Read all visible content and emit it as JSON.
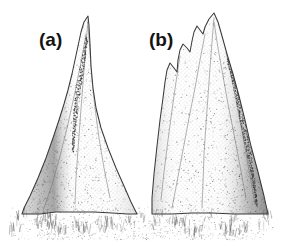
{
  "figure": {
    "medium": "pen-and-ink stipple drawing",
    "background_color": "#ffffff",
    "ink_color": "#3a3a3a",
    "width": 285,
    "height": 249
  },
  "panels": [
    {
      "id": "a",
      "label": "(a)",
      "label_x": 39,
      "label_y": 30,
      "description": "tall narrow sharply pointed conical termite mound with single spire",
      "apex": {
        "x": 88,
        "y": 16
      },
      "base": {
        "left_x": 22,
        "right_x": 137,
        "y": 214
      },
      "peak_count": 1,
      "shading_side": "left",
      "outline": "M 88 16 L 84 22 L 81 32 L 78 46 L 75 60 L 72 74 L 68 90 L 64 104 L 59 120 L 53 138 L 46 158 L 38 178 L 30 196 L 24 208 L 22 214 L 40 214 L 56 212 L 74 212 L 94 212 L 112 213 L 128 214 L 137 214 L 131 202 L 124 186 L 116 168 L 108 148 L 101 128 L 96 108 L 93 88 L 91 66 L 90 44 L 89 26 Z",
      "ridge_lines": [
        "M 88 20 L 86 44 L 84 70 L 82 96 L 80 122 L 78 150 L 76 178 L 75 204",
        "M 88 26 L 90 52 L 92 80 L 95 108 L 99 138 L 104 168 L 110 198",
        "M 86 34 L 81 62 L 75 92 L 68 124 L 60 156 L 51 188 L 44 208"
      ],
      "dark_streak": "M 87 38 L 83 62 L 79 86 L 76 110 L 74 132 L 73 152"
    },
    {
      "id": "b",
      "label": "(b)",
      "label_x": 149,
      "label_y": 30,
      "description": "broader termite mound with multiple jagged peaks and a lower side spur",
      "apex": {
        "x": 214,
        "y": 13
      },
      "base": {
        "left_x": 152,
        "right_x": 268,
        "y": 214
      },
      "peak_count": 3,
      "shading_side": "right",
      "outline": "M 214 13 L 209 19 L 205 27 L 203 34 L 200 30 L 197 26 L 194 32 L 192 41 L 190 52 L 187 48 L 183 44 L 180 50 L 178 60 L 177 72 L 174 68 L 170 63 L 167 70 L 165 82 L 163 98 L 160 120 L 157 146 L 154 174 L 152 198 L 152 214 L 172 214 L 192 213 L 212 213 L 234 214 L 252 214 L 268 214 L 264 196 L 258 172 L 251 146 L 245 120 L 239 96 L 233 74 L 227 54 L 222 36 L 218 22 Z",
      "ridge_lines": [
        "M 214 18 L 212 42 L 210 68 L 208 96 L 206 124 L 204 154 L 203 184 L 202 208",
        "M 214 22 L 218 48 L 223 76 L 228 104 L 234 134 L 240 166 L 246 198",
        "M 205 34 L 200 60 L 195 88 L 189 118 L 183 150 L 177 182 L 172 208",
        "M 180 56 L 176 82 L 172 110 L 168 140 L 164 172 L 161 200",
        "M 226 52 L 232 80 L 238 110 L 244 142 L 250 176 L 255 204"
      ],
      "dark_streak": "M 228 58 L 236 90 L 243 122 L 249 154 L 254 184 L 257 206"
    }
  ],
  "ground": {
    "description": "stippled ground line with small grass tufts at the base of each mound",
    "y": 214,
    "grass_extent_y": 238,
    "tuft_color": "#4a4a4a"
  }
}
